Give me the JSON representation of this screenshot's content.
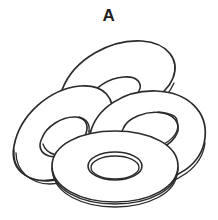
{
  "figure": {
    "label": "A",
    "style": "black and white technical line drawing",
    "background_color": "#ffffff",
    "line_color": "#2b2b2b",
    "label_color": "#231f20",
    "canvas": {
      "width": 218,
      "height": 220
    }
  },
  "objects": [
    {
      "id": "washer-rear-top",
      "name": "rear top washer",
      "order": 1,
      "center": {
        "x": 117,
        "y": 70
      },
      "outer_radii": {
        "rx": 62,
        "ry": 26
      },
      "inner_radii": {
        "rx": 26,
        "ry": 11
      },
      "rotation_deg": -16,
      "thickness_px": 4
    },
    {
      "id": "washer-left",
      "name": "left washer",
      "order": 2,
      "center": {
        "x": 57,
        "y": 131
      },
      "outer_radii": {
        "rx": 47,
        "ry": 35
      },
      "inner_radii": {
        "rx": 22,
        "ry": 13
      },
      "rotation_deg": -22,
      "thickness_px": 6
    },
    {
      "id": "washer-right",
      "name": "right washer",
      "order": 3,
      "center": {
        "x": 146,
        "y": 118
      },
      "outer_radii": {
        "rx": 58,
        "ry": 38
      },
      "inner_radii": {
        "rx": 25,
        "ry": 14
      },
      "rotation_deg": -11,
      "thickness_px": 6
    },
    {
      "id": "washer-front",
      "name": "front washer",
      "order": 4,
      "center": {
        "x": 115,
        "y": 166
      },
      "outer_radii": {
        "rx": 63,
        "ry": 36
      },
      "inner_radii": {
        "rx": 26,
        "ry": 14
      },
      "rotation_deg": 0,
      "thickness_px": 5
    }
  ]
}
